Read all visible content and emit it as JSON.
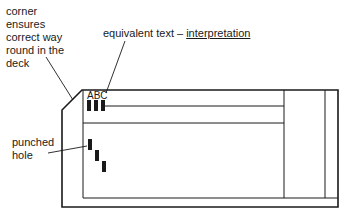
{
  "diagram": {
    "labels": {
      "corner": [
        "corner",
        "ensures",
        "correct way",
        "round in the",
        "deck"
      ],
      "equivalent_text": "equivalent text – ",
      "interpretation": "interpretation",
      "punched_hole": [
        "punched",
        "hole"
      ],
      "card_chars": "ABC"
    },
    "colors": {
      "ink": "#1a1a1a",
      "background": "#ffffff"
    }
  }
}
